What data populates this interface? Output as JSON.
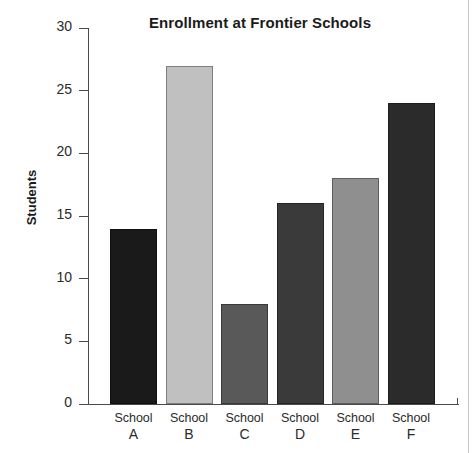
{
  "chart_data": {
    "type": "bar",
    "title": "Enrollment at Frontier Schools",
    "xlabel": "",
    "ylabel": "Students",
    "categories": [
      "School A",
      "School B",
      "School C",
      "School D",
      "School E",
      "School F"
    ],
    "category_lines": [
      {
        "line1": "School",
        "line2": "A"
      },
      {
        "line1": "School",
        "line2": "B"
      },
      {
        "line1": "School",
        "line2": "C"
      },
      {
        "line1": "School",
        "line2": "D"
      },
      {
        "line1": "School",
        "line2": "E"
      },
      {
        "line1": "School",
        "line2": "F"
      }
    ],
    "values": [
      14,
      27,
      8,
      16,
      18,
      24
    ],
    "bar_colors": [
      "#1a1a1a",
      "#c0c0c0",
      "#595959",
      "#3a3a3a",
      "#8f8f8f",
      "#2b2b2b"
    ],
    "ylim": [
      0,
      30
    ],
    "ytick_labels": [
      "0",
      "5",
      "10",
      "15",
      "20",
      "25",
      "30"
    ],
    "ytick_values": [
      0,
      5,
      10,
      15,
      20,
      25,
      30
    ],
    "grid": false,
    "legend": null
  }
}
